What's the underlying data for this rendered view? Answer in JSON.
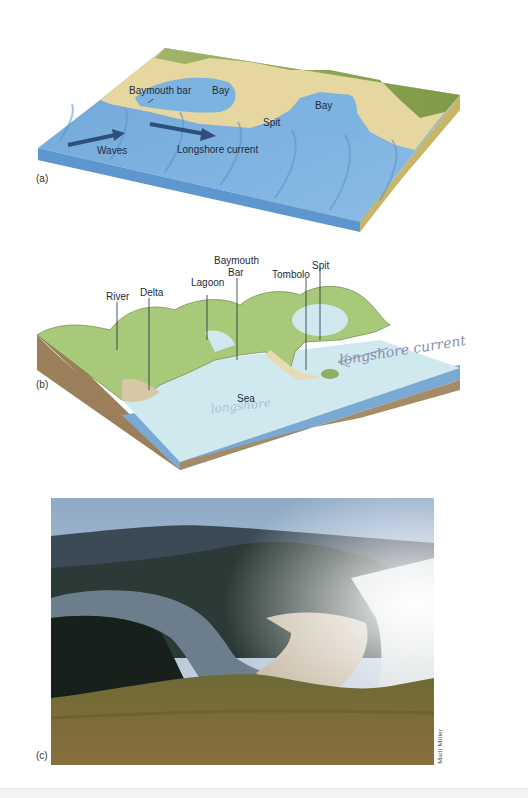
{
  "figure": {
    "panels": [
      {
        "id": "a",
        "label": "(a)",
        "type": "block-diagram",
        "annotations": {
          "baymouth_bar": "Baymouth bar",
          "bay_left": "Bay",
          "bay_right": "Bay",
          "spit": "Spit",
          "waves": "Waves",
          "longshore_current": "Longshore current"
        }
      },
      {
        "id": "b",
        "label": "(b)",
        "type": "block-diagram",
        "annotations": {
          "river": "River",
          "delta": "Delta",
          "lagoon": "Lagoon",
          "baymouth_bar_line1": "Baymouth",
          "baymouth_bar_line2": "Bar",
          "tombolo": "Tombolo",
          "spit": "Spit",
          "sea": "Sea"
        },
        "handwriting": {
          "longshore_current": "longshore current",
          "faint_note": "longshore"
        }
      },
      {
        "id": "c",
        "label": "(c)",
        "type": "photograph",
        "credit": "Marli Miller"
      }
    ],
    "colors": {
      "water_a": "#7fb2de",
      "water_a_dark": "#4f8fcc",
      "sand": "#e8d9a4",
      "grass": "#8fa65a",
      "water_b": "#cde9ef",
      "water_b_side": "#7aa9d4",
      "land_b": "#a8c97a",
      "earth_b": "#9b7f5a",
      "arrow": "#2f4f7a"
    }
  }
}
